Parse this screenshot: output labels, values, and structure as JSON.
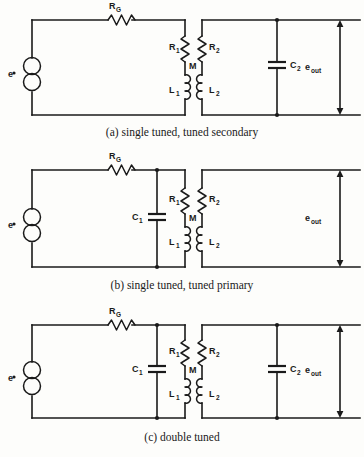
{
  "figure": {
    "kind": "circuit-diagram",
    "background_color": "#fdfdfb",
    "ink_color": "#1a1a1a"
  },
  "labels": {
    "source": "e",
    "generator_resistor": "R",
    "generator_resistor_sub": "G",
    "r1": "R",
    "r1_sub": "1",
    "r2": "R",
    "r2_sub": "2",
    "l1": "L",
    "l1_sub": "1",
    "l2": "L",
    "l2_sub": "2",
    "mutual": "M",
    "c1": "C",
    "c1_sub": "1",
    "c2": "C",
    "c2_sub": "2",
    "out": "e",
    "out_sub": "out"
  },
  "circuits": [
    {
      "id": "a",
      "caption": "(a)  single tuned, tuned secondary",
      "has_c1": false,
      "has_c2": true,
      "components": [
        "e",
        "RG",
        "R1",
        "L1",
        "M",
        "R2",
        "L2",
        "C2",
        "eout"
      ]
    },
    {
      "id": "b",
      "caption": "(b)  single tuned, tuned primary",
      "has_c1": true,
      "has_c2": false,
      "components": [
        "e",
        "RG",
        "C1",
        "R1",
        "L1",
        "M",
        "R2",
        "L2",
        "eout"
      ]
    },
    {
      "id": "c",
      "caption": "(c)  double tuned",
      "has_c1": true,
      "has_c2": true,
      "components": [
        "e",
        "RG",
        "C1",
        "R1",
        "L1",
        "M",
        "R2",
        "L2",
        "C2",
        "eout"
      ]
    }
  ]
}
